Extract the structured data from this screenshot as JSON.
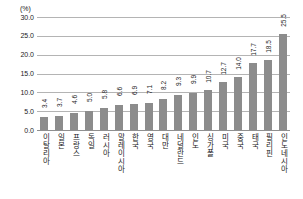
{
  "chart_data": {
    "type": "bar",
    "title": "",
    "subtitle": "",
    "xlabel": "",
    "ylabel": "(%)",
    "ylim": [
      0,
      30
    ],
    "ytick_labels": [
      "30.0",
      "25.0",
      "20.0",
      "15.0",
      "10.0",
      "5.0",
      "0.0"
    ],
    "ytick_values": [
      30,
      25,
      20,
      15,
      10,
      5,
      0
    ],
    "grid": true,
    "legend": false,
    "legend_position": "none",
    "bar_color": "#8c8c8c",
    "gridline_color": "#b4b4b4",
    "categories": [
      "이탈리아",
      "일본",
      "프랑스",
      "독일",
      "러시아",
      "말레이시아",
      "한국",
      "영국",
      "대만",
      "네덜란드",
      "인도",
      "싱가폴",
      "미국",
      "중국",
      "태국",
      "필리핀",
      "인도네시아"
    ],
    "values": [
      3.4,
      3.7,
      4.6,
      5.0,
      5.8,
      6.6,
      6.9,
      7.1,
      8.2,
      9.3,
      9.9,
      10.7,
      12.7,
      14.0,
      17.7,
      18.5,
      25.5
    ],
    "value_labels": [
      "3.4",
      "3.7",
      "4.6",
      "5.0",
      "5.8",
      "6.6",
      "6.9",
      "7.1",
      "8.2",
      "9.3",
      "9.9",
      "10.7",
      "12.7",
      "14.0",
      "17.7",
      "18.5",
      "25.5"
    ]
  }
}
